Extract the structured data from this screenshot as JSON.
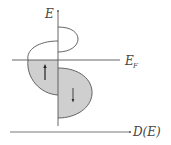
{
  "diagram": {
    "labels": {
      "energy_axis": "E",
      "fermi_level": "E",
      "fermi_sub": "F",
      "dos_axis": "D(E)"
    },
    "arrows": {
      "spin_up": "↑",
      "spin_down": "↓"
    },
    "colors": {
      "line": "#555555",
      "fill": "#cfcfcf",
      "background": "#ffffff"
    }
  }
}
